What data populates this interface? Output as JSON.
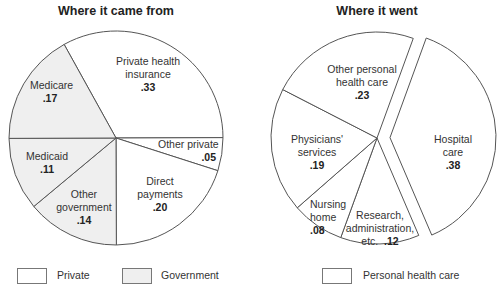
{
  "chart_data": [
    {
      "type": "pie",
      "title": "Where it came from",
      "slices": [
        {
          "label": "Private health insurance",
          "value": 0.33,
          "value_label": ".33",
          "group": "Private"
        },
        {
          "label": "Other private",
          "value": 0.05,
          "value_label": ".05",
          "group": "Private"
        },
        {
          "label": "Direct payments",
          "value": 0.2,
          "value_label": ".20",
          "group": "Private"
        },
        {
          "label": "Other government",
          "value": 0.14,
          "value_label": ".14",
          "group": "Government"
        },
        {
          "label": "Medicaid",
          "value": 0.11,
          "value_label": ".11",
          "group": "Government"
        },
        {
          "label": "Medicare",
          "value": 0.17,
          "value_label": ".17",
          "group": "Government"
        }
      ],
      "legend": [
        {
          "label": "Private",
          "color": "#ffffff"
        },
        {
          "label": "Government",
          "color": "#efefef"
        }
      ]
    },
    {
      "type": "pie",
      "title": "Where it went",
      "slices": [
        {
          "label": "Hospital care",
          "value": 0.38,
          "value_label": ".38",
          "exploded": true
        },
        {
          "label": "Research, administration, etc.",
          "value": 0.12,
          "value_label": ".12"
        },
        {
          "label": "Nursing home",
          "value": 0.08,
          "value_label": ".08"
        },
        {
          "label": "Physicians' services",
          "value": 0.19,
          "value_label": ".19"
        },
        {
          "label": "Other personal health care",
          "value": 0.23,
          "value_label": ".23"
        }
      ],
      "legend": [
        {
          "label": "Personal health care",
          "color": "#ffffff"
        }
      ]
    }
  ],
  "left": {
    "title": "Where it came from",
    "labels": {
      "phi": {
        "line1": "Private health",
        "line2": "insurance",
        "value": ".33"
      },
      "other_private": {
        "line1": "Other private",
        "value": ".05"
      },
      "direct": {
        "line1": "Direct",
        "line2": "payments",
        "value": ".20"
      },
      "other_gov": {
        "line1": "Other",
        "line2": "government",
        "value": ".14"
      },
      "medicaid": {
        "line1": "Medicaid",
        "value": ".11"
      },
      "medicare": {
        "line1": "Medicare",
        "value": ".17"
      }
    },
    "legend": {
      "private": "Private",
      "government": "Government"
    }
  },
  "right": {
    "title": "Where it went",
    "labels": {
      "hospital": {
        "line1": "Hospital",
        "line2": "care",
        "value": ".38"
      },
      "research": {
        "line1": "Research,",
        "line2": "administration,",
        "line3": "etc.",
        "value": ".12"
      },
      "nursing": {
        "line1": "Nursing",
        "line2": "home",
        "value": ".08"
      },
      "physicians": {
        "line1": "Physicians'",
        "line2": "services",
        "value": ".19"
      },
      "other_personal": {
        "line1": "Other personal",
        "line2": "health care",
        "value": ".23"
      }
    },
    "legend": {
      "personal": "Personal health care"
    }
  },
  "colors": {
    "private": "#ffffff",
    "government": "#efefef",
    "stroke": "#555555"
  }
}
